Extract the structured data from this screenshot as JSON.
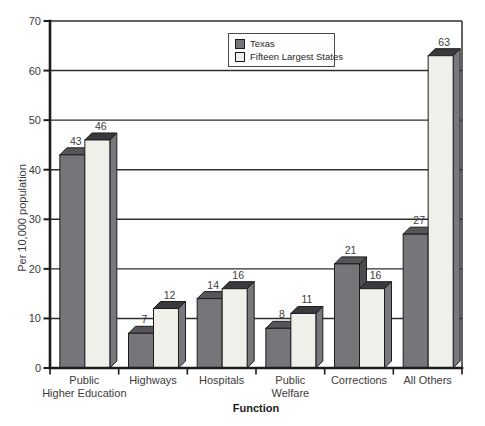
{
  "chart_data": {
    "type": "bar",
    "bar_style": "3d-bevel",
    "categories": [
      "Public Higher Education",
      "Highways",
      "Hospitals",
      "Public Welfare",
      "Corrections",
      "All Others"
    ],
    "category_lines": [
      [
        "Public",
        "Higher Education"
      ],
      [
        "Highways"
      ],
      [
        "Hospitals"
      ],
      [
        "Public",
        "Welfare"
      ],
      [
        "Corrections"
      ],
      [
        "All Others"
      ]
    ],
    "series": [
      {
        "name": "Texas",
        "values": [
          43,
          7,
          14,
          8,
          21,
          27
        ]
      },
      {
        "name": "Fifteen Largest States",
        "values": [
          46,
          12,
          16,
          11,
          16,
          63
        ]
      }
    ],
    "xlabel": "Function",
    "ylabel": "Per 10,000 population",
    "ylim": [
      0,
      70
    ],
    "ytick_step": 10,
    "grid": true,
    "legend_position": "top-center",
    "value_labels_shown": true
  },
  "style": {
    "series_colors": [
      {
        "front": "#75757a",
        "top": "#55555a",
        "side": "#4b4b50"
      },
      {
        "front": "#f0f0ea",
        "top": "#3a3a3e",
        "side": "#77777c"
      }
    ],
    "axis_color": "#1c1c1c",
    "grid_color": "#2e2e2e",
    "text_color": "#3c3c3c",
    "background": "#ffffff"
  }
}
